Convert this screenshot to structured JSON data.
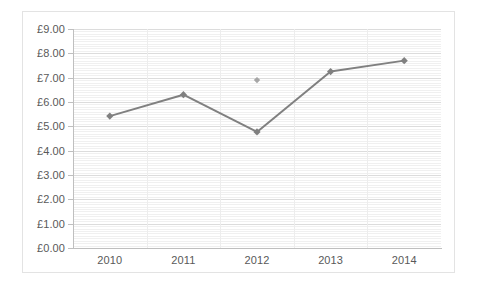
{
  "chart_data": {
    "type": "line",
    "title": "",
    "xlabel": "",
    "ylabel": "",
    "categories": [
      "2010",
      "2011",
      "2012",
      "2013",
      "2014"
    ],
    "ytick_labels": [
      "£9.00",
      "£8.00",
      "£7.00",
      "£6.00",
      "£5.00",
      "£4.00",
      "£3.00",
      "£2.00",
      "£1.00",
      "£0.00"
    ],
    "ytick_values": [
      9,
      8,
      7,
      6,
      5,
      4,
      3,
      2,
      1,
      0
    ],
    "ylim": [
      0,
      9
    ],
    "ytick_step": 1,
    "minor_gridline_step": 0.1,
    "grid": true,
    "legend": false,
    "currency_symbol": "£",
    "series": [
      {
        "name": "Series 1",
        "connected": true,
        "color": "#808080",
        "marker": "diamond",
        "values": [
          5.42,
          6.3,
          4.77,
          7.25,
          7.7
        ]
      },
      {
        "name": "Orphan point",
        "connected": false,
        "color": "#a6a6a6",
        "marker": "diamond",
        "points": [
          {
            "category": "2012",
            "value": 6.9
          }
        ]
      }
    ]
  },
  "style": {
    "axis_color": "#bfbfbf",
    "major_grid_color": "#dcdcdc",
    "minor_grid_color": "#f0f0f0",
    "border_color": "#e3e3e3",
    "tick_label_color": "#595959",
    "plot_background": "#ffffff"
  }
}
